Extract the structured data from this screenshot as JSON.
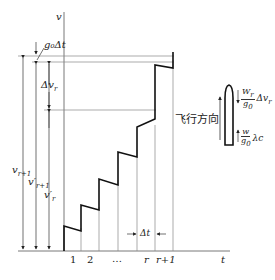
{
  "diagram": {
    "axes": {
      "y_label": "v",
      "x_label": "t"
    },
    "x_ticks": [
      "1",
      "2",
      "…",
      "r",
      "r+1"
    ],
    "annotations": {
      "g0_dt": "g₀Δt",
      "delta_vr": "Δv_r",
      "v_r1": "v_{r+1}",
      "vp_r1": "v'_{r+1}",
      "vp_r": "v'_r",
      "delta_t": "Δt"
    },
    "rocket": {
      "direction_label": "飞行方向",
      "thrust_term": {
        "numerator": "W_r",
        "denominator": "g₀",
        "suffix": "Δv_r"
      },
      "exhaust_term": {
        "numerator": "w",
        "denominator": "g₀",
        "suffix": "λc"
      }
    },
    "colors": {
      "line": "#222222",
      "grid": "#888888"
    }
  }
}
